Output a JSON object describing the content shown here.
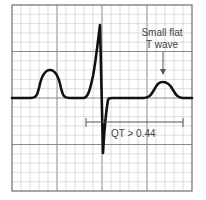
{
  "figure": {
    "annotation_t_wave": {
      "line1": "Small flat",
      "line2": "T wave"
    },
    "qt_label": "QT > 0.44",
    "colors": {
      "grid_minor": "#c8c8c8",
      "grid_major": "#8a8a8a",
      "border": "#707070",
      "trace": "#111111",
      "annotation": "#555555"
    }
  }
}
